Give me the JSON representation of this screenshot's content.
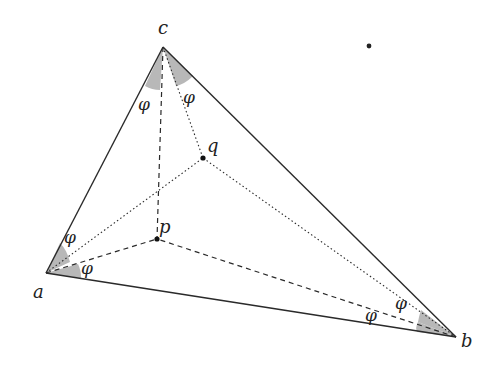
{
  "diagram": {
    "type": "geometry",
    "colors": {
      "stroke": "#2a2a2a",
      "shade": "#b8b8b8",
      "background": "#ffffff"
    },
    "vertices": {
      "a": {
        "label": "a",
        "x": 46,
        "y": 273
      },
      "b": {
        "label": "b",
        "x": 456,
        "y": 337
      },
      "c": {
        "label": "c",
        "x": 163,
        "y": 47
      }
    },
    "interior_points": {
      "p": {
        "label": "p",
        "x": 157,
        "y": 239
      },
      "q": {
        "label": "q",
        "x": 203,
        "y": 158
      }
    },
    "stray_dot": {
      "x": 369,
      "y": 46
    },
    "angle_label": "φ",
    "angle_labels": [
      {
        "id": "c-left",
        "text": "φ",
        "x": 138,
        "y": 110
      },
      {
        "id": "c-right",
        "text": "φ",
        "x": 186,
        "y": 101
      },
      {
        "id": "a-upper",
        "text": "φ",
        "x": 66,
        "y": 241
      },
      {
        "id": "a-lower",
        "text": "φ",
        "x": 82,
        "y": 272
      },
      {
        "id": "b-left",
        "text": "φ",
        "x": 365,
        "y": 319
      },
      {
        "id": "b-right",
        "text": "φ",
        "x": 396,
        "y": 307
      }
    ],
    "edges": [
      {
        "from": "a",
        "to": "b",
        "style": "solid"
      },
      {
        "from": "b",
        "to": "c",
        "style": "solid"
      },
      {
        "from": "c",
        "to": "a",
        "style": "solid"
      },
      {
        "from": "a",
        "to": "p",
        "style": "dashed"
      },
      {
        "from": "b",
        "to": "p",
        "style": "dashed"
      },
      {
        "from": "c",
        "to": "p",
        "style": "dashed"
      },
      {
        "from": "a",
        "to": "q",
        "style": "dotted"
      },
      {
        "from": "b",
        "to": "q",
        "style": "dotted"
      },
      {
        "from": "c",
        "to": "q",
        "style": "dotted"
      }
    ]
  }
}
